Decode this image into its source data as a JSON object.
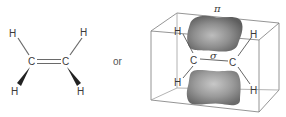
{
  "figure": {
    "connector_label": "or",
    "left_structure": {
      "name": "ethylene structural formula",
      "atoms": {
        "c_left": "C",
        "c_right": "C",
        "h_top_left": "H",
        "h_top_right": "H",
        "h_bottom_left": "H",
        "h_bottom_right": "H"
      }
    },
    "right_structure": {
      "name": "ethylene orbital model",
      "pi_label": "π",
      "sigma_label": "σ",
      "atoms": {
        "c_left": "C",
        "c_right": "C",
        "h_top_left": "H",
        "h_top_right": "H",
        "h_bottom_left": "H",
        "h_bottom_right": "H"
      }
    },
    "colors": {
      "line": "#6a6a6a",
      "text": "#3a3a3a",
      "lobe_dark": "#6e6e6e",
      "lobe_light": "#d8d8d8"
    }
  }
}
